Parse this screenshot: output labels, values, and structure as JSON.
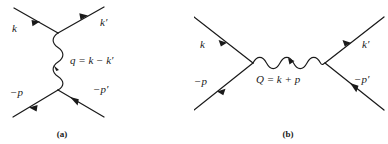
{
  "figure": {
    "type": "feynman-diagrams",
    "background_color": "#ffffff",
    "line_color": "#1a1a1a",
    "panel_count": 2
  },
  "panel_a": {
    "caption": "(a)",
    "topology": "t-channel",
    "propagator_orientation": "vertical",
    "labels": {
      "incoming_top_left": "k",
      "outgoing_top_right": "k′",
      "incoming_bottom_left": "−p",
      "outgoing_bottom_right": "−p′",
      "propagator": "q = k − k′",
      "propagator_symbol": "q",
      "propagator_expression": "k − k′"
    }
  },
  "panel_b": {
    "caption": "(b)",
    "topology": "s-channel",
    "propagator_orientation": "horizontal",
    "labels": {
      "incoming_top_left": "k",
      "outgoing_top_right": "k′",
      "incoming_bottom_left": "−p",
      "outgoing_bottom_right": "−p′",
      "propagator": "Q = k + p",
      "propagator_symbol": "Q",
      "propagator_expression": "k + p"
    }
  }
}
